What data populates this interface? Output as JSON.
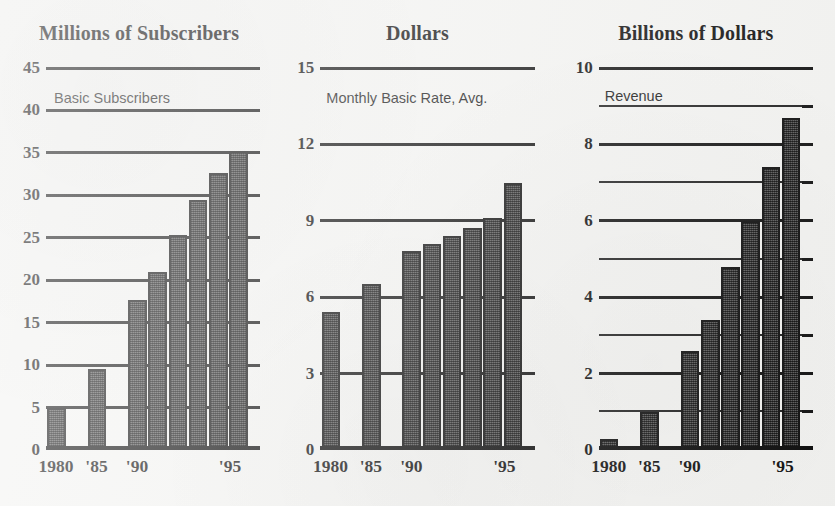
{
  "chart_data": [
    {
      "type": "bar",
      "title": "Millions of Subscribers",
      "subtitle": "Basic Subscribers",
      "xlabel": "",
      "ylabel": "Millions of Subscribers",
      "ylim": [
        0,
        45
      ],
      "grid": true,
      "legend": "none",
      "ytick_labels": [
        "45",
        "40",
        "35",
        "30",
        "25",
        "20",
        "15",
        "10",
        "5",
        "0"
      ],
      "yticks": [
        45,
        40,
        35,
        30,
        25,
        20,
        15,
        10,
        5,
        0
      ],
      "gridlines": [
        45,
        40,
        35,
        30,
        25,
        20,
        15,
        10,
        5,
        0
      ],
      "xtick_labels": [
        "1980",
        "'85",
        "'90",
        "'95"
      ],
      "xticks": [
        1980,
        1985,
        1990,
        1995
      ],
      "categories": [
        "1980",
        "1985",
        "1990",
        "1991",
        "1992",
        "1993",
        "1994",
        "1995"
      ],
      "values": [
        4.9,
        9.6,
        17.7,
        21.0,
        25.3,
        29.4,
        32.6,
        35.2
      ]
    },
    {
      "type": "bar",
      "title": "Dollars",
      "subtitle": "Monthly Basic Rate, Avg.",
      "xlabel": "",
      "ylabel": "Dollars",
      "ylim": [
        0,
        15
      ],
      "grid": true,
      "legend": "none",
      "ytick_labels": [
        "15",
        "12",
        "9",
        "6",
        "3",
        "0"
      ],
      "yticks": [
        15,
        12,
        9,
        6,
        3,
        0
      ],
      "gridlines": [
        15,
        12,
        9,
        6,
        3,
        0
      ],
      "xtick_labels": [
        "1980",
        "'85",
        "'90",
        "'95"
      ],
      "xticks": [
        1980,
        1985,
        1990,
        1995
      ],
      "categories": [
        "1980",
        "1985",
        "1990",
        "1991",
        "1992",
        "1993",
        "1994",
        "1995"
      ],
      "values": [
        5.4,
        6.5,
        7.8,
        8.1,
        8.4,
        8.7,
        9.1,
        10.5
      ]
    },
    {
      "type": "bar",
      "title": "Billions of Dollars",
      "subtitle": "Revenue",
      "xlabel": "",
      "ylabel": "Billions of Dollars",
      "ylim": [
        0,
        10
      ],
      "grid": true,
      "legend": "none",
      "ytick_labels": [
        "10",
        "8",
        "6",
        "4",
        "2",
        "0"
      ],
      "yticks": [
        10,
        8,
        6,
        4,
        2,
        0
      ],
      "gridlines": [
        10,
        9,
        8,
        7,
        6,
        5,
        4,
        3,
        2,
        1,
        0
      ],
      "xtick_labels": [
        "1980",
        "'85",
        "'90",
        "'95"
      ],
      "xticks": [
        1980,
        1985,
        1990,
        1995
      ],
      "categories": [
        "1980",
        "1985",
        "1990",
        "1991",
        "1992",
        "1993",
        "1994",
        "1995"
      ],
      "values": [
        0.3,
        1.0,
        2.6,
        3.4,
        4.8,
        6.0,
        7.4,
        8.7
      ]
    }
  ],
  "colors": {
    "background": "#f3f3f1",
    "ink": "#111111",
    "bar_fill": "#3b3b3b",
    "bar_stroke": "#101010"
  }
}
